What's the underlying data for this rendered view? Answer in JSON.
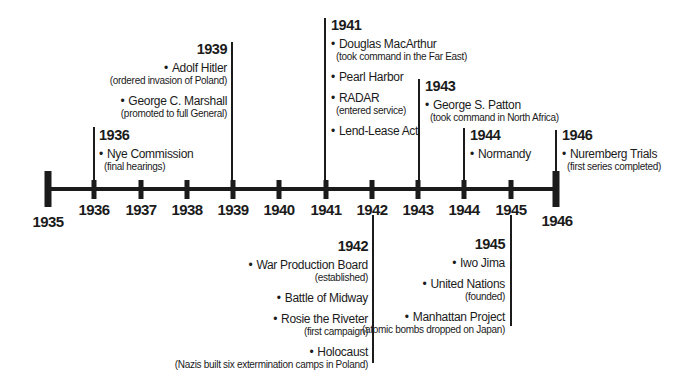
{
  "glyphs": {
    "bullet": "•"
  },
  "colors": {
    "ink": "#1b1b1b",
    "background": "#ffffff"
  },
  "timeline": {
    "axis_years": [
      "1935",
      "1936",
      "1937",
      "1938",
      "1939",
      "1940",
      "1941",
      "1942",
      "1943",
      "1944",
      "1945",
      "1946"
    ],
    "callouts": [
      {
        "year": "1936",
        "side": "above",
        "events": [
          {
            "name": "Nye Commission",
            "detail": "(final hearings)"
          }
        ]
      },
      {
        "year": "1939",
        "side": "above",
        "events": [
          {
            "name": "Adolf Hitler",
            "detail": "(ordered invasion of Poland)"
          },
          {
            "name": "George C. Marshall",
            "detail": "(promoted to full General)"
          }
        ]
      },
      {
        "year": "1941",
        "side": "above",
        "events": [
          {
            "name": "Douglas MacArthur",
            "detail": "(took command in the Far East)"
          },
          {
            "name": "Pearl Harbor"
          },
          {
            "name": "RADAR",
            "detail": "(entered service)"
          },
          {
            "name": "Lend-Lease Act"
          }
        ]
      },
      {
        "year": "1943",
        "side": "above",
        "events": [
          {
            "name": "George S. Patton",
            "detail": "(took command in North Africa)"
          }
        ]
      },
      {
        "year": "1944",
        "side": "above",
        "events": [
          {
            "name": "Normandy"
          }
        ]
      },
      {
        "year": "1946",
        "side": "above",
        "events": [
          {
            "name": "Nuremberg Trials",
            "detail": "(first series completed)"
          }
        ]
      },
      {
        "year": "1942",
        "side": "below",
        "events": [
          {
            "name": "War Production Board",
            "detail": "(established)"
          },
          {
            "name": "Battle of Midway"
          },
          {
            "name": "Rosie the Riveter",
            "detail": "(first campaign)"
          },
          {
            "name": "Holocaust",
            "detail": "(Nazis built six extermination camps in Poland)"
          }
        ]
      },
      {
        "year": "1945",
        "side": "below",
        "events": [
          {
            "name": "Iwo Jima"
          },
          {
            "name": "United Nations",
            "detail": "(founded)"
          },
          {
            "name": "Manhattan Project",
            "detail": "(atomic bombs dropped on Japan)"
          }
        ]
      }
    ]
  }
}
